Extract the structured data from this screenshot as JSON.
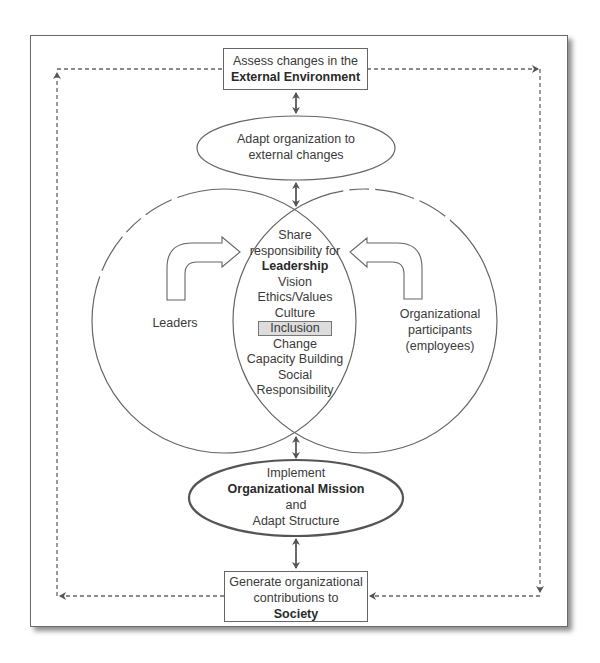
{
  "diagram": {
    "top_box": {
      "line1": "Assess changes in the",
      "line2_bold": "External Environment"
    },
    "adapt_ellipse": {
      "line1": "Adapt organization to",
      "line2": "external changes"
    },
    "center": {
      "line1": "Share",
      "line2": "responsibility for",
      "heading_bold": "Leadership",
      "items": [
        "Vision",
        "Ethics/Values",
        "Culture",
        "Inclusion",
        "Change",
        "Capacity Building",
        "Social",
        "Responsibility"
      ],
      "highlighted_item": "Inclusion"
    },
    "left_circle": {
      "label": "Leaders"
    },
    "right_circle": {
      "line1": "Organizational",
      "line2": "participants",
      "line3": "(employees)"
    },
    "mission_ellipse": {
      "line1": "Implement",
      "line2_bold": "Organizational Mission",
      "line3": "and",
      "line4": "Adapt Structure"
    },
    "bottom_box": {
      "line1": "Generate organizational",
      "line2": "contributions to",
      "line3_bold": "Society"
    },
    "colors": {
      "stroke": "#666666",
      "highlight_fill": "#dcdcdc",
      "text": "#3a3a3a"
    }
  }
}
